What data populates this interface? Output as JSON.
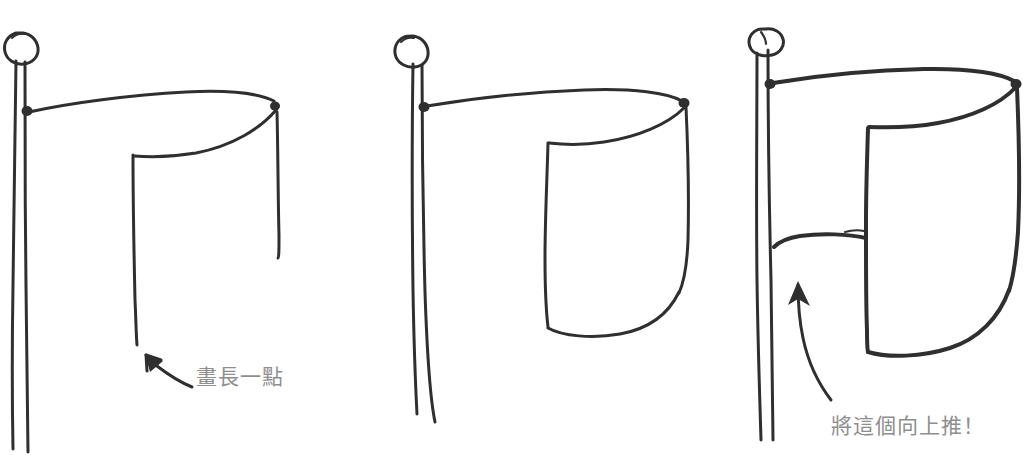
{
  "canvas": {
    "width": 1034,
    "height": 461,
    "background_color": "#ffffff",
    "ink_color": "#2f2f2f",
    "annotation_text_color": "#8e8e8e",
    "title": "Hand-drawn flag drawing tutorial — three steps"
  },
  "panels": [
    {
      "id": "panel-1",
      "step_number": 1,
      "description": "Flagpole with ball finial; flag top edge drawn as a long shallow curve, with an open fold shape below — two long vertical lines that are not yet joined at the bottom.",
      "flag_state": "open-fold-unclosed",
      "annotation": {
        "text": "畫長一點",
        "meaning": "draw it longer",
        "arrow": "arrow-up-left",
        "color": "#8e8e8e"
      }
    },
    {
      "id": "panel-2",
      "step_number": 2,
      "description": "Same flagpole; the flag fold is now closed at the bottom with a curved sweeping edge, forming a complete waving flag panel.",
      "flag_state": "closed-curved-bottom",
      "annotation": null
    },
    {
      "id": "panel-3",
      "step_number": 3,
      "description": "Same flag, but the near-left lower section of the cloth has been pushed upward, creating a raised horizontal hem line near the pole.",
      "flag_state": "lower-left-section-pushed-up",
      "annotation": {
        "text": "將這個向上推！",
        "meaning": "push this one upward!",
        "arrow": "curved-arrow-up",
        "color": "#8e8e8e"
      }
    }
  ],
  "annotations": {
    "note_1": "畫長一點",
    "note_2": "將這個向上推！"
  }
}
